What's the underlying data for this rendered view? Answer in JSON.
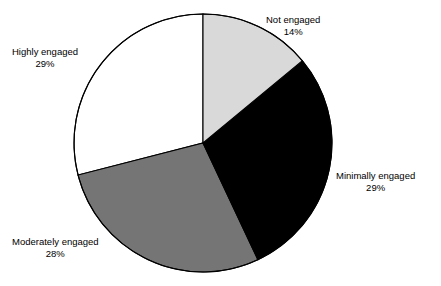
{
  "figure": {
    "title_cropped": "",
    "background_color": "#ffffff",
    "width": 441,
    "height": 286
  },
  "pie": {
    "center_x": 203,
    "center_y": 143,
    "radius": 129,
    "start_angle_deg": 0,
    "direction": "clockwise",
    "outline_color": "#000000"
  },
  "labels": {
    "not_engaged": {
      "name": "Not engaged",
      "value": "14%"
    },
    "minimally_engaged": {
      "name": "Minimally engaged",
      "value": "29%"
    },
    "moderately_engaged": {
      "name": "Moderately engaged",
      "value": "28%"
    },
    "highly_engaged": {
      "name": "Highly engaged",
      "value": "29%"
    }
  },
  "chart_data": {
    "type": "pie",
    "title": "",
    "xlabel": "",
    "ylabel": "",
    "legend": "none",
    "grid": false,
    "labels_position": "outside",
    "start_angle_deg": 0,
    "direction": "clockwise",
    "categories": [
      "Not engaged",
      "Minimally engaged",
      "Moderately engaged",
      "Highly engaged"
    ],
    "values": [
      14,
      29,
      28,
      29
    ],
    "value_labels": [
      "14%",
      "29%",
      "28%",
      "29%"
    ],
    "units": "percent",
    "total": 100,
    "colors": [
      "#d9d9d9",
      "#000000",
      "#757575",
      "#ffffff"
    ],
    "slices": [
      {
        "label": "Not engaged",
        "value": 14,
        "value_label": "14%",
        "color": "#d9d9d9",
        "angle_deg": 50.4,
        "start_deg": 0.0,
        "end_deg": 50.4
      },
      {
        "label": "Minimally engaged",
        "value": 29,
        "value_label": "29%",
        "color": "#000000",
        "angle_deg": 104.4,
        "start_deg": 50.4,
        "end_deg": 154.8
      },
      {
        "label": "Moderately engaged",
        "value": 28,
        "value_label": "28%",
        "color": "#757575",
        "angle_deg": 100.8,
        "start_deg": 154.8,
        "end_deg": 255.6
      },
      {
        "label": "Highly engaged",
        "value": 29,
        "value_label": "29%",
        "color": "#ffffff",
        "angle_deg": 104.4,
        "start_deg": 255.6,
        "end_deg": 360.0
      }
    ]
  }
}
